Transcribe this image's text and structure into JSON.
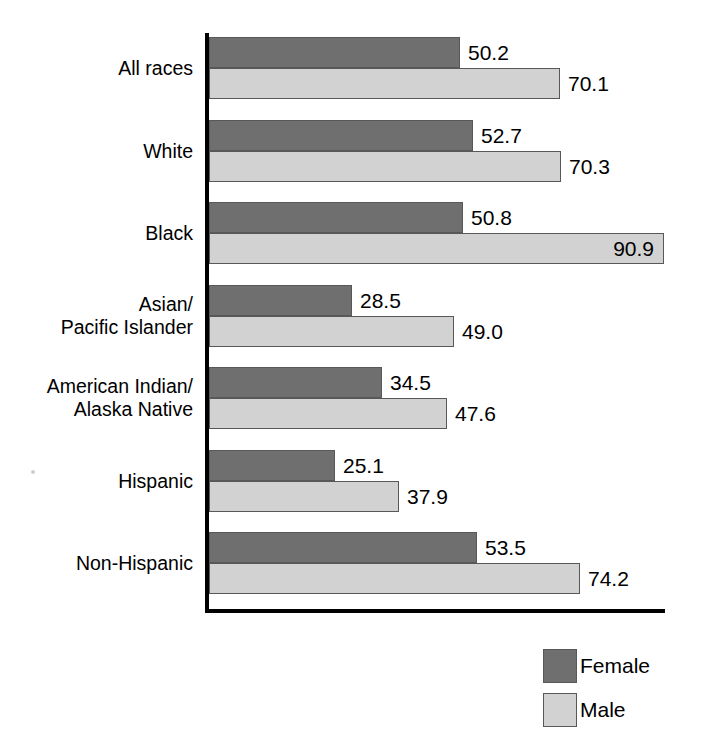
{
  "chart_data": {
    "type": "bar",
    "orientation": "horizontal",
    "title": "",
    "subtitle": "",
    "xlabel": "",
    "ylabel": "",
    "grid": false,
    "legend_position": "bottom-right",
    "xlim": [
      0,
      92
    ],
    "categories": [
      "All races",
      "White",
      "Black",
      "Asian/\nPacific Islander",
      "American Indian/\nAlaska Native",
      "Hispanic",
      "Non-Hispanic"
    ],
    "series": [
      {
        "name": "Female",
        "color": "#6f6f6f",
        "values": [
          50.2,
          52.7,
          50.8,
          28.5,
          34.5,
          25.1,
          53.5
        ],
        "labels": [
          "50.2",
          "52.7",
          "50.8",
          "28.5",
          "34.5",
          "25.1",
          "53.5"
        ]
      },
      {
        "name": "Male",
        "color": "#d2d2d2",
        "values": [
          70.1,
          70.3,
          90.9,
          49.0,
          47.6,
          37.9,
          74.2
        ],
        "labels": [
          "70.1",
          "70.3",
          "90.9",
          "49.0",
          "47.6",
          "37.9",
          "74.2"
        ]
      }
    ]
  },
  "groups": [
    {
      "label": "All races",
      "female": {
        "value": 50.2,
        "label": "50.2",
        "label_inside": false
      },
      "male": {
        "value": 70.1,
        "label": "70.1",
        "label_inside": false
      }
    },
    {
      "label": "White",
      "female": {
        "value": 52.7,
        "label": "52.7",
        "label_inside": false
      },
      "male": {
        "value": 70.3,
        "label": "70.3",
        "label_inside": false
      }
    },
    {
      "label": "Black",
      "female": {
        "value": 50.8,
        "label": "50.8",
        "label_inside": false
      },
      "male": {
        "value": 90.9,
        "label": "90.9",
        "label_inside": true
      }
    },
    {
      "label": "Asian/\nPacific Islander",
      "female": {
        "value": 28.5,
        "label": "28.5",
        "label_inside": false
      },
      "male": {
        "value": 49.0,
        "label": "49.0",
        "label_inside": false
      }
    },
    {
      "label": "American Indian/\nAlaska Native",
      "female": {
        "value": 34.5,
        "label": "34.5",
        "label_inside": false
      },
      "male": {
        "value": 47.6,
        "label": "47.6",
        "label_inside": false
      }
    },
    {
      "label": "Hispanic",
      "female": {
        "value": 25.1,
        "label": "25.1",
        "label_inside": false
      },
      "male": {
        "value": 37.9,
        "label": "37.9",
        "label_inside": false
      }
    },
    {
      "label": "Non-Hispanic",
      "female": {
        "value": 53.5,
        "label": "53.5",
        "label_inside": false
      },
      "male": {
        "value": 74.2,
        "label": "74.2",
        "label_inside": false
      }
    }
  ],
  "legend": {
    "items": [
      {
        "label": "Female",
        "color": "#6f6f6f",
        "key": "female"
      },
      {
        "label": "Male",
        "color": "#d2d2d2",
        "key": "male"
      }
    ]
  },
  "axis": {
    "line_color": "#000000",
    "scale_px_per_unit": 5.0,
    "origin_x_px": 209
  }
}
